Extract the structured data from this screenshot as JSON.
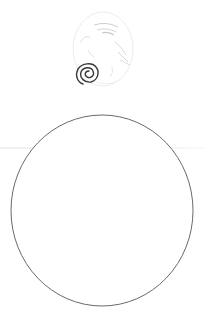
{
  "figure": {
    "description": "Scanned drawing: faint pencil sketch of a face-like figure with a dark spiral above a large outlined circle",
    "sketch": {
      "icon": "spiral-sketch-icon",
      "stroke_color": "#d8d8d8",
      "spiral_color": "#3a3a3a"
    },
    "circle": {
      "stroke_color": "#6a6a6a",
      "fill_color": "#ffffff"
    },
    "background_color": "#ffffff"
  }
}
